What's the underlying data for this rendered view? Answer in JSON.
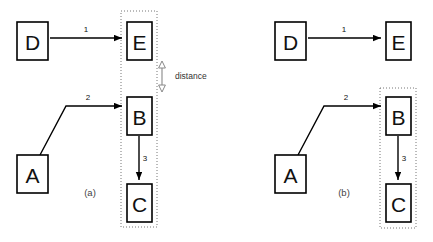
{
  "figure": {
    "width": 433,
    "height": 242,
    "background": "#ffffff",
    "stroke_color": "#000000",
    "group_stroke_color": "#777777",
    "measure_color": "#888888"
  },
  "panels": [
    {
      "id": "panel-a",
      "caption": "(a)",
      "caption_x": 90,
      "caption_y": 196,
      "nodes": [
        {
          "id": "D",
          "label": "D",
          "x": 17,
          "y": 22,
          "w": 31,
          "h": 38
        },
        {
          "id": "E",
          "label": "E",
          "x": 127,
          "y": 22,
          "w": 25,
          "h": 38
        },
        {
          "id": "B",
          "label": "B",
          "x": 127,
          "y": 97,
          "w": 25,
          "h": 38
        },
        {
          "id": "C",
          "label": "C",
          "x": 127,
          "y": 184,
          "w": 25,
          "h": 38
        },
        {
          "id": "A",
          "label": "A",
          "x": 17,
          "y": 155,
          "w": 31,
          "h": 38
        }
      ],
      "edges": [
        {
          "id": "edge-1",
          "label": "1",
          "label_x": 86,
          "label_y": 32,
          "points": "50,38 122,38"
        },
        {
          "id": "edge-2",
          "label": "2",
          "label_x": 88,
          "label_y": 100,
          "points": "40,155 66,106 122,106"
        },
        {
          "id": "edge-3",
          "label": "3",
          "label_x": 145,
          "label_y": 161,
          "points": "139,136 139,180"
        }
      ],
      "group": {
        "id": "group-a",
        "x": 121,
        "y": 11,
        "w": 36,
        "h": 216
      },
      "measure": {
        "id": "distance-measure",
        "label": "distance",
        "label_x": 175,
        "label_y": 79,
        "x": 162,
        "y_top": 61,
        "y_bottom": 92
      }
    },
    {
      "id": "panel-b",
      "caption": "(b)",
      "caption_x": 344,
      "caption_y": 196,
      "nodes": [
        {
          "id": "D",
          "label": "D",
          "x": 275,
          "y": 22,
          "w": 31,
          "h": 38
        },
        {
          "id": "E",
          "label": "E",
          "x": 386,
          "y": 22,
          "w": 25,
          "h": 38
        },
        {
          "id": "B",
          "label": "B",
          "x": 386,
          "y": 97,
          "w": 25,
          "h": 38
        },
        {
          "id": "C",
          "label": "C",
          "x": 386,
          "y": 184,
          "w": 25,
          "h": 38
        },
        {
          "id": "A",
          "label": "A",
          "x": 275,
          "y": 155,
          "w": 31,
          "h": 38
        }
      ],
      "edges": [
        {
          "id": "edge-1",
          "label": "1",
          "label_x": 344,
          "label_y": 32,
          "points": "308,38 381,38"
        },
        {
          "id": "edge-2",
          "label": "2",
          "label_x": 346,
          "label_y": 100,
          "points": "298,155 324,106 381,106"
        },
        {
          "id": "edge-3",
          "label": "3",
          "label_x": 404,
          "label_y": 161,
          "points": "398,136 398,180"
        }
      ],
      "group": {
        "id": "group-b",
        "x": 380,
        "y": 88,
        "w": 36,
        "h": 140
      },
      "measure": null
    }
  ]
}
